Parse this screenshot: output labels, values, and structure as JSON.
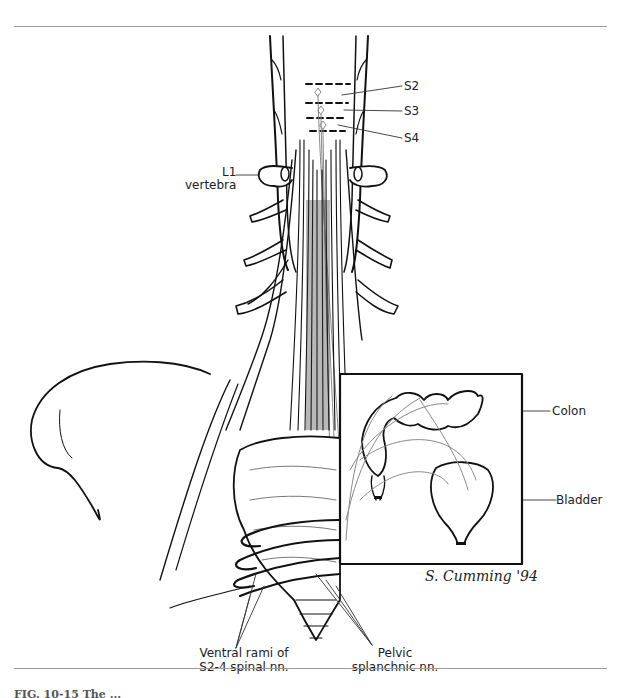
{
  "figure": {
    "labels": {
      "s2": "S2",
      "s3": "S3",
      "s4": "S4",
      "l1_line1": "L1",
      "l1_line2": "vertebra",
      "colon": "Colon",
      "bladder": "Bladder",
      "ventral_line1": "Ventral rami of",
      "ventral_line2": "S2-4 spinal nn.",
      "pelvic_line1": "Pelvic",
      "pelvic_line2": "splanchnic nn."
    },
    "signature": "S. Cumming '94",
    "caption_partial": "FIG. 10-15  The ..."
  },
  "colors": {
    "ink": "#111111",
    "gray_nerve": "#8a8a8a",
    "rule": "#9a9a9a"
  }
}
